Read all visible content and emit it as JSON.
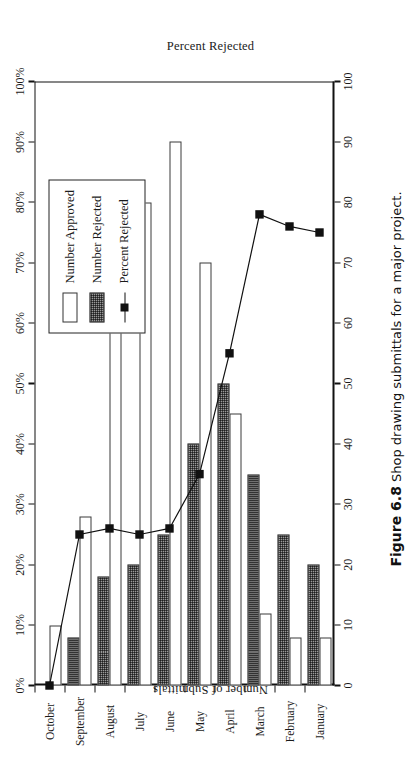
{
  "figure": {
    "number": "Figure 6.8",
    "caption": "Shop drawing submittals for a major project."
  },
  "chart_data": {
    "type": "bar",
    "title": "",
    "subtitle": "",
    "orientation": "rotated-90-ccw",
    "categories": [
      "January",
      "February",
      "March",
      "April",
      "May",
      "June",
      "July",
      "August",
      "September",
      "October"
    ],
    "series": [
      {
        "name": "Number Approved",
        "type": "bar",
        "axis": "left",
        "values": [
          8,
          8,
          12,
          45,
          70,
          90,
          80,
          60,
          28,
          10
        ]
      },
      {
        "name": "Number Rejected",
        "type": "bar",
        "axis": "left",
        "values": [
          20,
          25,
          35,
          50,
          40,
          25,
          20,
          18,
          8,
          0
        ]
      },
      {
        "name": "Percent Rejected",
        "type": "line",
        "axis": "right",
        "values": [
          75,
          76,
          78,
          55,
          35,
          26,
          25,
          26,
          25,
          0
        ]
      }
    ],
    "xlabel": "",
    "ylabel": "Number of Submittals",
    "y2label": "Percent Rejected",
    "ylim": [
      0,
      100
    ],
    "y2lim": [
      0,
      100
    ],
    "yticks": [
      "0",
      "10",
      "20",
      "30",
      "40",
      "50",
      "60",
      "70",
      "80",
      "90",
      "100"
    ],
    "y2ticks": [
      "0%",
      "10%",
      "20%",
      "30%",
      "40%",
      "50%",
      "60%",
      "70%",
      "80%",
      "90%",
      "100%"
    ],
    "grid": false,
    "legend_position": "upper-left",
    "legend": [
      "Number Approved",
      "Number Rejected",
      "Percent Rejected"
    ],
    "colors": {
      "approved_fill": "#ffffff",
      "rejected_fill": "#9a9a9a",
      "line": "#111111",
      "marker": "#111111",
      "axis": "#111111"
    }
  },
  "axes": {
    "left_title": "Number of Submittals",
    "right_title": "Percent Rejected"
  },
  "legend": {
    "items": [
      {
        "label": "Number Approved",
        "symbol": "open-rect-swatch"
      },
      {
        "label": "Number Rejected",
        "symbol": "hatched-rect-swatch"
      },
      {
        "label": "Percent Rejected",
        "symbol": "line-with-square-marker"
      }
    ]
  }
}
